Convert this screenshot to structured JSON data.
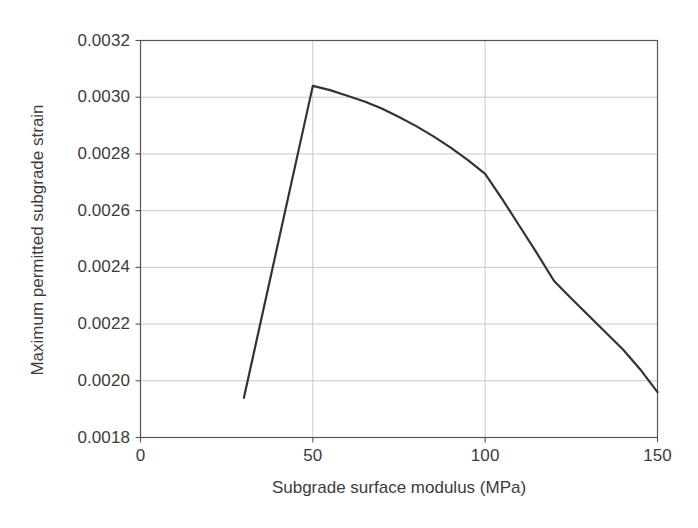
{
  "chart_data": {
    "type": "line",
    "title": "",
    "xlabel": "Subgrade surface modulus (MPa)",
    "ylabel": "Maximum permitted subgrade strain",
    "xlim": [
      0,
      150
    ],
    "ylim": [
      0.0018,
      0.0032
    ],
    "xticks": [
      0,
      50,
      100,
      150
    ],
    "xtick_labels": [
      "0",
      "50",
      "100",
      "150"
    ],
    "yticks": [
      0.0018,
      0.002,
      0.0022,
      0.0024,
      0.0026,
      0.0028,
      0.003,
      0.0032
    ],
    "ytick_labels": [
      "0.0018",
      "0.0020",
      "0.0022",
      "0.0024",
      "0.0026",
      "0.0028",
      "0.0030",
      "0.0032"
    ],
    "grid": true,
    "grid_axis": "both",
    "legend": null,
    "series": [
      {
        "name": "Maximum permitted subgrade strain",
        "color": "#333333",
        "linewidth": 2.2,
        "x": [
          30,
          50,
          55,
          60,
          65,
          70,
          75,
          80,
          85,
          90,
          95,
          100,
          105,
          110,
          115,
          120,
          125,
          130,
          135,
          140,
          145,
          150
        ],
        "y": [
          0.00194,
          0.00304,
          0.003025,
          0.003005,
          0.002985,
          0.00296,
          0.00293,
          0.002898,
          0.002862,
          0.002822,
          0.002778,
          0.00273,
          0.00264,
          0.002545,
          0.00245,
          0.002352,
          0.00229,
          0.00223,
          0.00217,
          0.00211,
          0.00204,
          0.00196
        ]
      }
    ]
  },
  "axes": {
    "x_tick_values": [
      "0",
      "50",
      "100",
      "150"
    ],
    "y_tick_values": [
      "0.0032",
      "0.0030",
      "0.0028",
      "0.0026",
      "0.0024",
      "0.0022",
      "0.0020",
      "0.0018"
    ],
    "x_axis_title": "Subgrade surface modulus (MPa)",
    "y_axis_title": "Maximum permitted subgrade strain"
  },
  "style": {
    "background": "#ffffff",
    "line_color": "#333333",
    "grid_color": "#c8c8c8",
    "frame_color": "#555555",
    "text_color": "#3c3c3c"
  }
}
